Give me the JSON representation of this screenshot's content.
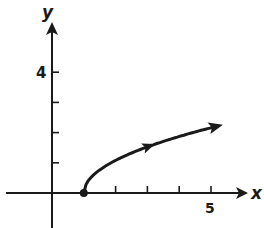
{
  "chart_data": {
    "type": "line",
    "title": "",
    "xlabel": "x",
    "ylabel": "y",
    "x_tick_labels": [
      {
        "value": 5,
        "label": "5"
      }
    ],
    "y_tick_labels": [
      {
        "value": 4,
        "label": "4"
      }
    ],
    "x_ticks": [
      1,
      2,
      3,
      4,
      5
    ],
    "y_ticks": [
      1,
      2,
      3,
      4
    ],
    "xlim": [
      -1.5,
      6.5
    ],
    "ylim": [
      -1.2,
      5.2
    ],
    "grid": false,
    "legend": null,
    "series": [
      {
        "name": "y = sqrt(x - 1)",
        "start_point": {
          "x": 1,
          "y": 0,
          "marker": "closed-dot"
        },
        "end": "arrow",
        "direction_arrow_at": {
          "x": 3,
          "y": 1.41
        },
        "x": [
          1,
          1.25,
          1.5,
          2,
          2.5,
          3,
          3.5,
          4,
          4.5,
          5,
          5.2
        ],
        "y": [
          0,
          0.5,
          0.71,
          1,
          1.22,
          1.41,
          1.58,
          1.73,
          1.87,
          2,
          2.05
        ]
      }
    ]
  },
  "labels": {
    "x_axis": "x",
    "y_axis": "y",
    "y4": "4",
    "x5": "5"
  },
  "colors": {
    "ink": "#1a1a1a",
    "background": "#ffffff"
  }
}
